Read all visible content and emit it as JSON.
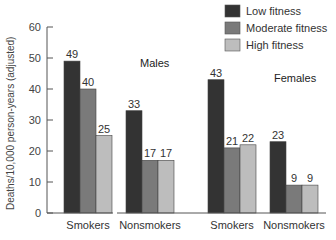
{
  "chart_data": {
    "type": "bar",
    "title": "",
    "xlabel": "",
    "ylabel": "Deaths/10,000 person-years (adjusted)",
    "ylim": [
      0,
      60
    ],
    "yticks": [
      0,
      10,
      20,
      30,
      40,
      50,
      60
    ],
    "grid": false,
    "legend_position": "top-right",
    "groups": [
      "Males",
      "Females"
    ],
    "categories": [
      "Smokers",
      "Nonsmokers",
      "Smokers",
      "Nonsmokers"
    ],
    "category_group": [
      "Males",
      "Males",
      "Females",
      "Females"
    ],
    "series": [
      {
        "name": "Low fitness",
        "color": "#333333",
        "values": [
          49,
          33,
          43,
          23
        ]
      },
      {
        "name": "Moderate fitness",
        "color": "#7a7a7a",
        "values": [
          40,
          17,
          21,
          9
        ]
      },
      {
        "name": "High fitness",
        "color": "#bdbdbd",
        "values": [
          25,
          17,
          22,
          9
        ]
      }
    ]
  },
  "legend": {
    "items": [
      {
        "label": "Low fitness",
        "color": "#333333"
      },
      {
        "label": "Moderate fitness",
        "color": "#7a7a7a"
      },
      {
        "label": "High fitness",
        "color": "#bdbdbd"
      }
    ]
  },
  "labels": {
    "males": "Males",
    "females": "Females",
    "ylabel": "Deaths/10,000 person-years (adjusted)"
  }
}
